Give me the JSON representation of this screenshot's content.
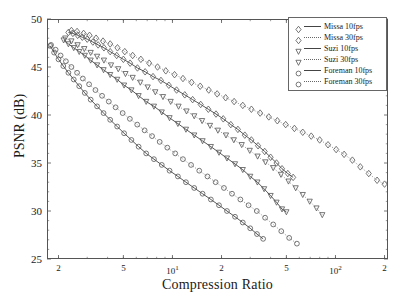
{
  "chart_data": {
    "type": "scatter",
    "title": "",
    "xlabel": "Compression Ratio",
    "ylabel": "PSNR (dB)",
    "xscale": "log",
    "yscale": "linear",
    "xlim": [
      1.7,
      210
    ],
    "ylim": [
      25,
      50
    ],
    "grid": false,
    "legend_position": "top-right",
    "ytick_labels": [
      "50",
      "45",
      "40",
      "35",
      "30",
      "25"
    ],
    "ytick_values": [
      50,
      45,
      40,
      35,
      30,
      25
    ],
    "xtick_labels": [
      "2",
      "5",
      "10",
      "2",
      "5",
      "100",
      "2"
    ],
    "xtick_values": [
      2,
      5,
      10,
      20,
      50,
      100,
      200
    ],
    "series": [
      {
        "name": "Missa 10fps",
        "marker": "diamond",
        "line": "solid",
        "points": [
          [
            2.3,
            48.6
          ],
          [
            2.45,
            48.5
          ],
          [
            2.62,
            48.3
          ],
          [
            2.8,
            48.1
          ],
          [
            3.0,
            47.9
          ],
          [
            3.25,
            47.6
          ],
          [
            3.5,
            47.3
          ],
          [
            3.8,
            47.0
          ],
          [
            4.15,
            46.6
          ],
          [
            4.55,
            46.2
          ],
          [
            5.0,
            45.8
          ],
          [
            5.5,
            45.4
          ],
          [
            6.1,
            44.9
          ],
          [
            6.8,
            44.5
          ],
          [
            7.6,
            44.0
          ],
          [
            8.5,
            43.6
          ],
          [
            9.5,
            43.1
          ],
          [
            10.6,
            42.6
          ],
          [
            11.9,
            42.1
          ],
          [
            13.3,
            41.6
          ],
          [
            14.9,
            41.1
          ],
          [
            16.6,
            40.6
          ],
          [
            18.5,
            40.1
          ],
          [
            20.5,
            39.6
          ],
          [
            22.8,
            39.0
          ],
          [
            25.2,
            38.5
          ],
          [
            27.8,
            37.9
          ],
          [
            30.5,
            37.4
          ],
          [
            33.5,
            36.8
          ],
          [
            36.8,
            36.2
          ],
          [
            40.0,
            35.6
          ],
          [
            43.5,
            35.0
          ],
          [
            47.0,
            34.4
          ],
          [
            51.0,
            33.9
          ],
          [
            55.0,
            33.5
          ]
        ]
      },
      {
        "name": "Missa 30fps",
        "marker": "diamond",
        "line": "dotted",
        "points": [
          [
            2.4,
            48.8
          ],
          [
            2.6,
            48.7
          ],
          [
            2.85,
            48.5
          ],
          [
            3.1,
            48.3
          ],
          [
            3.4,
            48.0
          ],
          [
            3.75,
            47.7
          ],
          [
            4.15,
            47.4
          ],
          [
            4.6,
            47.0
          ],
          [
            5.1,
            46.6
          ],
          [
            5.7,
            46.2
          ],
          [
            6.4,
            45.8
          ],
          [
            7.2,
            45.4
          ],
          [
            8.1,
            45.0
          ],
          [
            9.1,
            44.6
          ],
          [
            10.3,
            44.2
          ],
          [
            11.6,
            43.8
          ],
          [
            13.1,
            43.4
          ],
          [
            14.8,
            43.0
          ],
          [
            16.7,
            42.6
          ],
          [
            18.8,
            42.2
          ],
          [
            21.2,
            41.8
          ],
          [
            23.9,
            41.4
          ],
          [
            27.0,
            41.0
          ],
          [
            30.5,
            40.6
          ],
          [
            34.5,
            40.2
          ],
          [
            39.0,
            39.8
          ],
          [
            44.0,
            39.4
          ],
          [
            49.5,
            39.0
          ],
          [
            56.0,
            38.6
          ],
          [
            63.0,
            38.2
          ],
          [
            71.0,
            37.8
          ],
          [
            80.0,
            37.4
          ],
          [
            90.0,
            36.9
          ],
          [
            101,
            36.4
          ],
          [
            113,
            35.9
          ],
          [
            127,
            35.3
          ],
          [
            142,
            34.6
          ],
          [
            160,
            33.9
          ],
          [
            180,
            33.2
          ],
          [
            200,
            32.8
          ]
        ]
      },
      {
        "name": "Suzi 10fps",
        "marker": "triangle-down",
        "line": "solid",
        "points": [
          [
            2.15,
            47.8
          ],
          [
            2.3,
            47.4
          ],
          [
            2.48,
            47.0
          ],
          [
            2.68,
            46.6
          ],
          [
            2.9,
            46.2
          ],
          [
            3.15,
            45.7
          ],
          [
            3.45,
            45.2
          ],
          [
            3.78,
            44.7
          ],
          [
            4.15,
            44.2
          ],
          [
            4.58,
            43.7
          ],
          [
            5.05,
            43.1
          ],
          [
            5.6,
            42.6
          ],
          [
            6.2,
            42.0
          ],
          [
            6.9,
            41.4
          ],
          [
            7.7,
            40.9
          ],
          [
            8.6,
            40.3
          ],
          [
            9.6,
            39.7
          ],
          [
            10.8,
            39.1
          ],
          [
            12.1,
            38.5
          ],
          [
            13.6,
            37.9
          ],
          [
            15.3,
            37.3
          ],
          [
            17.2,
            36.7
          ],
          [
            19.3,
            36.1
          ],
          [
            21.6,
            35.5
          ],
          [
            24.2,
            34.9
          ],
          [
            27.0,
            34.3
          ],
          [
            30.0,
            33.6
          ],
          [
            33.2,
            33.0
          ],
          [
            36.5,
            32.3
          ],
          [
            40.0,
            31.6
          ],
          [
            43.5,
            30.9
          ],
          [
            47.0,
            30.2
          ],
          [
            50.0,
            29.9
          ]
        ]
      },
      {
        "name": "Suzi 30fps",
        "marker": "triangle-down",
        "line": "dotted",
        "points": [
          [
            2.2,
            48.0
          ],
          [
            2.4,
            47.7
          ],
          [
            2.62,
            47.3
          ],
          [
            2.88,
            46.9
          ],
          [
            3.15,
            46.5
          ],
          [
            3.45,
            46.1
          ],
          [
            3.8,
            45.7
          ],
          [
            4.2,
            45.2
          ],
          [
            4.65,
            44.8
          ],
          [
            5.15,
            44.3
          ],
          [
            5.7,
            43.9
          ],
          [
            6.35,
            43.4
          ],
          [
            7.05,
            42.9
          ],
          [
            7.85,
            42.4
          ],
          [
            8.75,
            41.9
          ],
          [
            9.75,
            41.4
          ],
          [
            10.9,
            40.9
          ],
          [
            12.2,
            40.4
          ],
          [
            13.6,
            39.9
          ],
          [
            15.2,
            39.4
          ],
          [
            17.0,
            38.9
          ],
          [
            19.0,
            38.4
          ],
          [
            21.3,
            37.9
          ],
          [
            23.8,
            37.4
          ],
          [
            26.6,
            36.9
          ],
          [
            29.8,
            36.3
          ],
          [
            33.3,
            35.7
          ],
          [
            37.2,
            35.1
          ],
          [
            41.5,
            34.5
          ],
          [
            46.3,
            33.8
          ],
          [
            51.5,
            33.1
          ],
          [
            57.0,
            32.4
          ],
          [
            63.0,
            31.7
          ],
          [
            69.5,
            31.0
          ],
          [
            76.5,
            30.3
          ],
          [
            83.0,
            29.6
          ]
        ]
      },
      {
        "name": "Foreman 10fps",
        "marker": "circle",
        "line": "solid",
        "points": [
          [
            1.78,
            47.2
          ],
          [
            1.88,
            46.5
          ],
          [
            2.0,
            45.8
          ],
          [
            2.14,
            45.1
          ],
          [
            2.3,
            44.4
          ],
          [
            2.48,
            43.7
          ],
          [
            2.68,
            43.0
          ],
          [
            2.9,
            42.3
          ],
          [
            3.15,
            41.6
          ],
          [
            3.45,
            40.9
          ],
          [
            3.78,
            40.2
          ],
          [
            4.15,
            39.5
          ],
          [
            4.58,
            38.8
          ],
          [
            5.05,
            38.1
          ],
          [
            5.6,
            37.4
          ],
          [
            6.2,
            36.7
          ],
          [
            6.9,
            36.0
          ],
          [
            7.7,
            35.4
          ],
          [
            8.6,
            34.8
          ],
          [
            9.6,
            34.2
          ],
          [
            10.8,
            33.6
          ],
          [
            12.1,
            33.0
          ],
          [
            13.6,
            32.4
          ],
          [
            15.3,
            31.8
          ],
          [
            17.2,
            31.2
          ],
          [
            19.3,
            30.6
          ],
          [
            21.6,
            30.0
          ],
          [
            24.2,
            29.4
          ],
          [
            27.0,
            28.8
          ],
          [
            30.0,
            28.2
          ],
          [
            33.0,
            27.6
          ],
          [
            36.0,
            27.1
          ]
        ]
      },
      {
        "name": "Foreman 30fps",
        "marker": "circle",
        "line": "dotted",
        "points": [
          [
            1.8,
            47.3
          ],
          [
            1.92,
            46.8
          ],
          [
            2.06,
            46.2
          ],
          [
            2.22,
            45.6
          ],
          [
            2.4,
            45.0
          ],
          [
            2.6,
            44.4
          ],
          [
            2.82,
            43.8
          ],
          [
            3.08,
            43.2
          ],
          [
            3.37,
            42.6
          ],
          [
            3.7,
            42.0
          ],
          [
            4.07,
            41.4
          ],
          [
            4.48,
            40.8
          ],
          [
            4.95,
            40.2
          ],
          [
            5.48,
            39.6
          ],
          [
            6.08,
            39.0
          ],
          [
            6.75,
            38.4
          ],
          [
            7.5,
            37.8
          ],
          [
            8.35,
            37.2
          ],
          [
            9.3,
            36.6
          ],
          [
            10.4,
            36.0
          ],
          [
            11.6,
            35.4
          ],
          [
            13.0,
            34.8
          ],
          [
            14.6,
            34.2
          ],
          [
            16.4,
            33.6
          ],
          [
            18.4,
            33.0
          ],
          [
            20.7,
            32.4
          ],
          [
            23.2,
            31.8
          ],
          [
            26.1,
            31.2
          ],
          [
            29.3,
            30.6
          ],
          [
            32.9,
            30.0
          ],
          [
            37.0,
            29.3
          ],
          [
            41.5,
            28.6
          ],
          [
            46.5,
            27.9
          ],
          [
            52.0,
            27.2
          ],
          [
            58.0,
            26.6
          ]
        ]
      }
    ]
  },
  "legend": {
    "entries": [
      {
        "label": "Missa 10fps"
      },
      {
        "label": "Missa 30fps"
      },
      {
        "label": "Suzi 10fps"
      },
      {
        "label": "Suzi 30fps"
      },
      {
        "label": "Foreman 10fps"
      },
      {
        "label": "Foreman 30fps"
      }
    ]
  },
  "style": {
    "line_color": "#444444",
    "dotted_color": "#777777",
    "marker_color": "#555555",
    "axis_color": "#555555",
    "background": "#ffffff"
  }
}
